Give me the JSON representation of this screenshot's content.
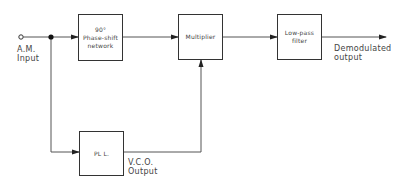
{
  "diagram": {
    "title": "",
    "input": {
      "label_line1": "A.M.",
      "label_line2": "Input"
    },
    "blocks": {
      "phase_shift": {
        "line1": "90°",
        "line2": "Phase-shift",
        "line3": "network"
      },
      "multiplier": {
        "line1": "Multiplier"
      },
      "low_pass": {
        "line1": "Low-pass",
        "line2": "filter"
      },
      "pll": {
        "line1": "PL L."
      }
    },
    "output": {
      "label_line1": "Demodulated",
      "label_line2": "output"
    },
    "vco": {
      "label_line1": "V.C.O.",
      "label_line2": "Output"
    },
    "colors": {
      "stroke": "#333333",
      "text": "#444444",
      "background": "#ffffff"
    }
  }
}
